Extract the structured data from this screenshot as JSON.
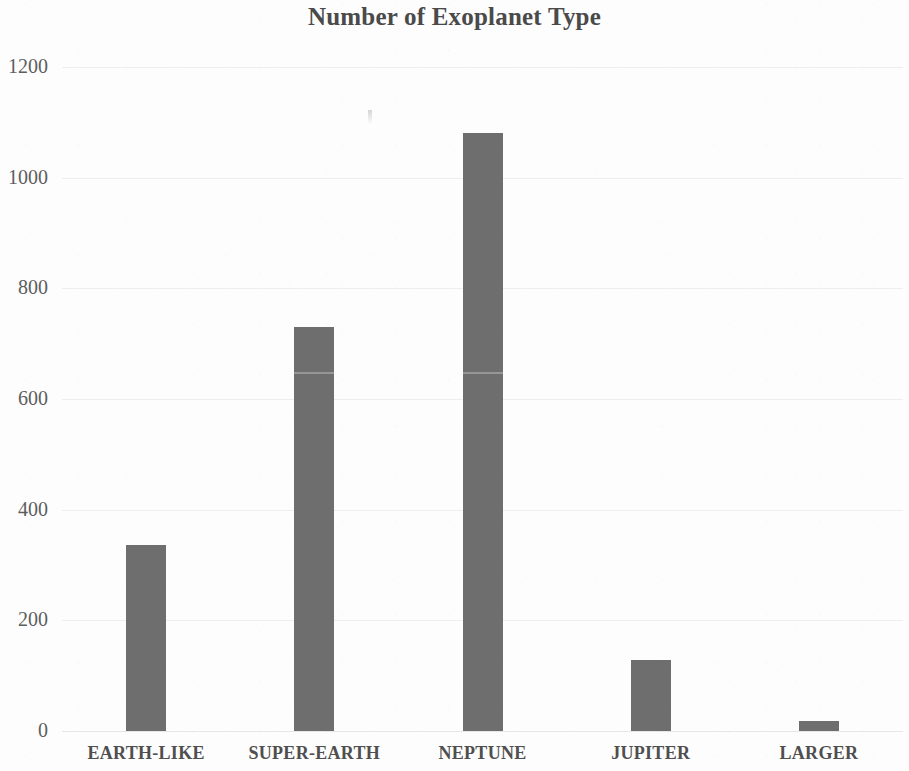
{
  "chart_data": {
    "type": "bar",
    "title": "Number of Exoplanet Type",
    "xlabel": "",
    "ylabel": "",
    "categories": [
      "EARTH-LIKE",
      "SUPER-EARTH",
      "NEPTUNE",
      "JUPITER",
      "LARGER"
    ],
    "values": [
      336,
      730,
      1081,
      128,
      18
    ],
    "series": [
      {
        "name": "Number of Exoplanets",
        "values": [
          336,
          730,
          1081,
          128,
          18
        ]
      }
    ],
    "ylim": [
      0,
      1200
    ],
    "y_ticks": [
      0,
      200,
      400,
      600,
      800,
      1000,
      1200
    ],
    "y_tick_labels": [
      "0",
      "200",
      "400",
      "600",
      "800",
      "1000",
      "1200"
    ],
    "grid": true,
    "grid_axis": "y",
    "legend": false,
    "legend_position": "none",
    "bar_color": "#6e6e6e",
    "grid_color": "#eeeeee",
    "title_color": "#4a4a4a",
    "tick_label_color": "#5d5d5d",
    "category_label_color": "#4f4f4f",
    "background_color": "#fdfdfd"
  }
}
